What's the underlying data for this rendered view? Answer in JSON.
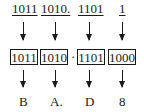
{
  "diagram": {
    "binary_groups": [
      "1011",
      "1010.",
      "1101",
      "1"
    ],
    "padded_groups": [
      "1011",
      "1010",
      "1101",
      "1000"
    ],
    "separator": "·",
    "hex_digits": [
      "B",
      "A.",
      "D",
      "8"
    ]
  }
}
